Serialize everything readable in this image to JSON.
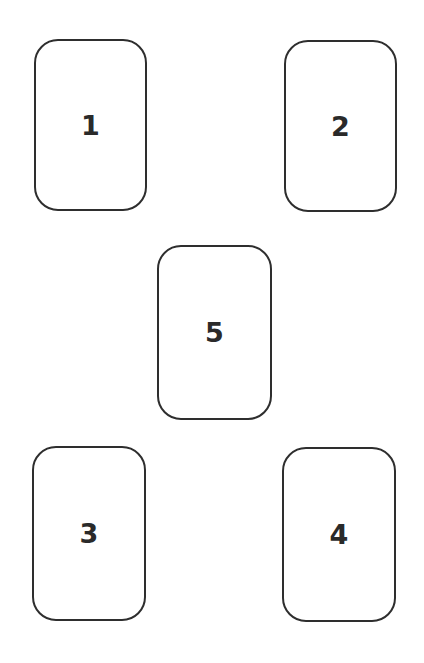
{
  "layout": {
    "description": "Five-card spread: four corner positions and one center position",
    "cards": [
      {
        "position": 1,
        "label": "1"
      },
      {
        "position": 2,
        "label": "2"
      },
      {
        "position": 3,
        "label": "3"
      },
      {
        "position": 4,
        "label": "4"
      },
      {
        "position": 5,
        "label": "5"
      }
    ]
  },
  "colors": {
    "background": "#ffffff",
    "border": "#2e2e2e",
    "text": "#2a2a2a"
  }
}
